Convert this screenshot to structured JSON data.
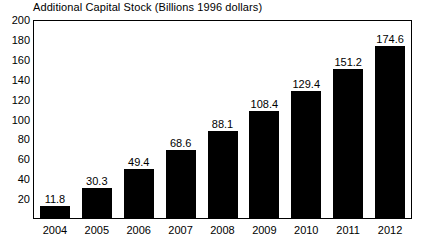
{
  "chart_data": {
    "type": "bar",
    "title": "Additional Capital Stock (Billions 1996 dollars)",
    "xlabel": "",
    "ylabel": "",
    "categories": [
      "2004",
      "2005",
      "2006",
      "2007",
      "2008",
      "2009",
      "2010",
      "2011",
      "2012"
    ],
    "values": [
      11.8,
      30.3,
      49.4,
      68.6,
      88.1,
      108.4,
      129.4,
      151.2,
      174.6
    ],
    "value_labels": [
      "11.8",
      "30.3",
      "49.4",
      "68.6",
      "88.1",
      "108.4",
      "129.4",
      "151.2",
      "174.6"
    ],
    "ylim": [
      0,
      200
    ],
    "ytick_values": [
      20,
      40,
      60,
      80,
      100,
      120,
      140,
      160,
      180,
      200
    ],
    "ytick_labels": [
      "20",
      "40",
      "60",
      "80",
      "100",
      "120",
      "140",
      "160",
      "180",
      "200"
    ],
    "grid": false,
    "legend": null,
    "bar_color": "#000000",
    "axis_color": "#000000",
    "background_color": "#ffffff"
  }
}
